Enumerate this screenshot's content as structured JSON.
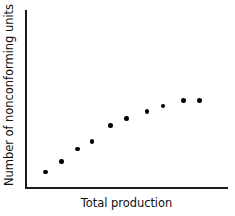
{
  "chart_data": {
    "type": "scatter",
    "title": "",
    "subtitle": "",
    "xlabel": "Total production",
    "ylabel": "Number of nonconforming units",
    "xlim": [
      0,
      100
    ],
    "ylim": [
      0,
      100
    ],
    "grid": false,
    "legend": null,
    "legend_position": "none",
    "x_tick_labels": [],
    "y_tick_labels": [],
    "annotations": [],
    "marker": {
      "shape": "circle",
      "color": "#000000",
      "size_px": 4.6,
      "filled": true
    },
    "axis_color": "#1a1a1a",
    "background_color": "#ffffff",
    "series": [
      {
        "name": "nonconforming units",
        "points": [
          {
            "x": 10,
            "y": 9
          },
          {
            "x": 18,
            "y": 15
          },
          {
            "x": 26,
            "y": 22
          },
          {
            "x": 33,
            "y": 26
          },
          {
            "x": 42,
            "y": 35
          },
          {
            "x": 50,
            "y": 39
          },
          {
            "x": 60,
            "y": 43
          },
          {
            "x": 68,
            "y": 46
          },
          {
            "x": 78,
            "y": 49
          },
          {
            "x": 86,
            "y": 49
          }
        ]
      }
    ]
  }
}
